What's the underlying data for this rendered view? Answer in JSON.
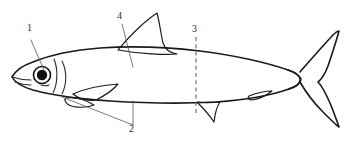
{
  "figure": {
    "kind": "line-drawing",
    "background_color": "#ffffff",
    "ink_color": "#1a1a1a",
    "leader_color": "#555555",
    "section_line_color": "#666666",
    "width": 347,
    "height": 145
  },
  "callouts": [
    {
      "id": "callout-1",
      "label": "1",
      "target": "eye",
      "label_x": 27,
      "label_y": 28,
      "leader": "M31,40 L44,72"
    },
    {
      "id": "callout-2",
      "label": "2",
      "target": "paired-fins",
      "label_x": 129,
      "label_y": 124,
      "leader_a": "M62,96 L133,125",
      "leader_b": "M133,100 L133,125"
    },
    {
      "id": "callout-3",
      "label": "3",
      "target": "cross-section-plane",
      "label_x": 192,
      "label_y": 28,
      "section_line": "M196,38 L196,112"
    },
    {
      "id": "callout-4",
      "label": "4",
      "target": "body-flank",
      "label_x": 117,
      "label_y": 15,
      "leader": "M122,24 L133,66"
    }
  ],
  "shapes": {
    "body_outline": "M12,77 C16,70 24,65 33,62 C50,55 74,50 100,48 C130,46 166,47 200,51 C238,56 268,63 288,70 C296,73 300,76 301,79 C301,83 297,86 289,89 C272,95 246,100 216,102 C180,104 142,103 110,101 C80,99 52,95 33,90 C23,87 15,83 12,77 Z",
    "head_gill_line": "M56,60 C59,70 59,82 55,92",
    "gill_curve_1": "M62,62 C66,72 66,83 62,93",
    "operculum_arc": "M20,66 C15,72 15,82 20,89",
    "mouth_line": "M13,78 C19,80 27,81 33,80",
    "mouth_line_2": "M16,82 C21,84 27,85 32,84",
    "dorsal_fin": "M118,49 C126,39 142,22 157,13 C159,19 161,33 163,42 C165,48 170,52 176,53 C166,54 140,53 118,49 Z",
    "pectoral_fin": "M73,93 C86,88 104,85 117,84 C112,90 104,96 96,99 C88,100 79,98 73,93 Z",
    "pelvic_fin": "M68,98 C76,98 86,100 93,104 C86,107 76,107 70,104 C67,102 66,99 68,98 Z",
    "anal_fin": "M198,103 C204,108 210,115 213,121 C214,114 216,107 219,103 C212,104 204,104 198,103 Z",
    "adipose_fin": "M248,97 C256,94 264,92 271,92 C266,96 258,99 251,100 C248,100 246,99 248,97 Z",
    "peduncle_top": "M288,70 C294,72 298,75 300,79",
    "caudal_fin": "M299,79 C306,71 318,55 332,39 C334,36 336,34 338,33 C336,40 331,54 327,66 C324,74 321,79 318,82 C321,86 325,93 329,102 C333,112 336,120 338,125 C335,123 330,118 323,111 C313,101 304,88 299,80 Z",
    "lateral_line": "M60,76 C100,74 150,74 200,76 C240,78 270,80 288,82"
  }
}
